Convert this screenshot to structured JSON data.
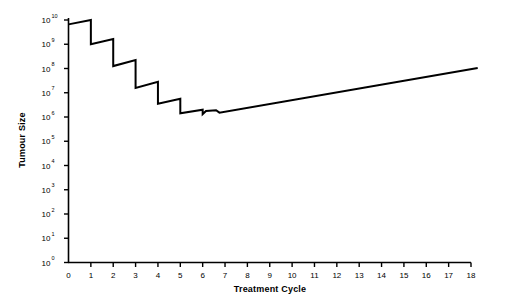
{
  "chart_data": {
    "type": "line",
    "title": "",
    "subtitle": "",
    "xlabel": "Treatment Cycle",
    "ylabel": "Tumour Size",
    "xlim": [
      0,
      18
    ],
    "ylim": [
      0,
      10
    ],
    "yscale": "log10",
    "grid": false,
    "legend": null,
    "x_ticks": [
      "0",
      "1",
      "2",
      "3",
      "4",
      "5",
      "6",
      "7",
      "8",
      "9",
      "10",
      "11",
      "12",
      "13",
      "14",
      "15",
      "16",
      "17",
      "18"
    ],
    "y_ticks": [
      {
        "mantissa": "10",
        "exponent": "0"
      },
      {
        "mantissa": "10",
        "exponent": "1"
      },
      {
        "mantissa": "10",
        "exponent": "2"
      },
      {
        "mantissa": "10",
        "exponent": "3"
      },
      {
        "mantissa": "10",
        "exponent": "4"
      },
      {
        "mantissa": "10",
        "exponent": "5"
      },
      {
        "mantissa": "10",
        "exponent": "6"
      },
      {
        "mantissa": "10",
        "exponent": "7"
      },
      {
        "mantissa": "10",
        "exponent": "8"
      },
      {
        "mantissa": "10",
        "exponent": "9"
      },
      {
        "mantissa": "10",
        "exponent": "10"
      }
    ],
    "series": [
      {
        "name": "Tumour burden",
        "color": "#000000",
        "linewidth": 2,
        "comment": "Sawtooth: regrowth between cycles, log-kill drop at each treatment; nadir near 10^6.2 at cycle 5-7, then resistant regrowth to 10^8",
        "x": [
          0.0,
          1.0,
          1.0,
          2.0,
          2.0,
          3.0,
          3.0,
          4.0,
          4.0,
          5.0,
          5.0,
          6.0,
          6.0,
          6.15,
          6.6,
          6.75,
          18.3
        ],
        "y": [
          9.82,
          10.0,
          9.0,
          9.22,
          8.1,
          8.35,
          7.2,
          7.45,
          6.55,
          6.75,
          6.15,
          6.3,
          6.12,
          6.25,
          6.28,
          6.18,
          8.02
        ]
      }
    ]
  },
  "axes": {
    "x_axis_name": "treatment-cycle-axis",
    "y_axis_name": "tumour-size-axis"
  }
}
